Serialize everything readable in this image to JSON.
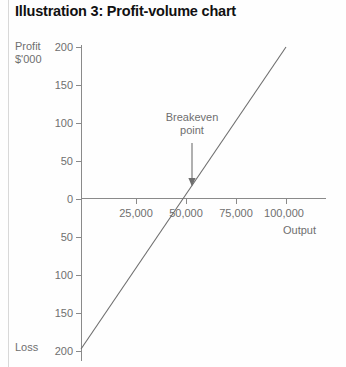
{
  "title": "Illustration 3: Profit-volume chart",
  "axis_titles": {
    "profit": "Profit",
    "units": "$'000",
    "loss": "Loss",
    "output": "Output"
  },
  "annotation": {
    "breakeven_label": "Breakeven\npoint"
  },
  "colors": {
    "title": "#111111",
    "text": "#6f6f6f",
    "axis": "#8a8a8a",
    "series": "#6e6e6e",
    "page_rule": "#d8d8d8"
  },
  "chart_data": {
    "type": "line",
    "title": "Illustration 3: Profit-volume chart",
    "xlabel": "Output",
    "ylabel": "Profit $'000",
    "ylabel_negative": "Loss",
    "grid": false,
    "legend": null,
    "xlim": [
      0,
      115000
    ],
    "ylim": [
      -200,
      200
    ],
    "x_ticks": [
      25000,
      50000,
      75000,
      100000
    ],
    "x_tick_labels": [
      "25,000",
      "50,000",
      "75,000",
      "100,000"
    ],
    "y_ticks": [
      200,
      150,
      100,
      50,
      0,
      -50,
      -100,
      -150,
      -200
    ],
    "y_tick_labels": [
      "200",
      "150",
      "100",
      "50",
      "0",
      "50",
      "100",
      "150",
      "200"
    ],
    "series": [
      {
        "name": "Profit",
        "x": [
          0,
          50000,
          100000
        ],
        "values": [
          -200,
          0,
          200
        ]
      }
    ],
    "annotations": [
      {
        "text": "Breakeven\npoint",
        "x": 50000,
        "y": 0,
        "arrow": "down"
      }
    ]
  }
}
